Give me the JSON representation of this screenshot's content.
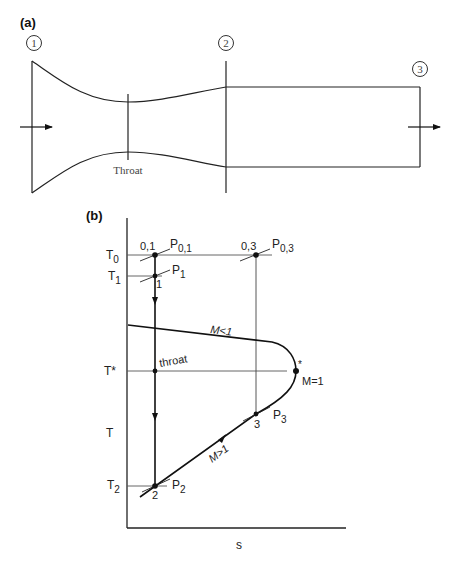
{
  "panel_a": {
    "label": "(a)",
    "stations": [
      "1",
      "2",
      "3"
    ],
    "throat_label": "Throat",
    "flow_direction": "left-to-right"
  },
  "panel_b": {
    "label": "(b)",
    "axis": {
      "y_label": "T",
      "x_label": "s"
    },
    "temperature_levels": {
      "T0": {
        "main": "T",
        "sub": "0"
      },
      "T1": {
        "main": "T",
        "sub": "1"
      },
      "Tstar": {
        "main": "T*"
      },
      "T2": {
        "main": "T",
        "sub": "2"
      }
    },
    "points": {
      "p01": {
        "state": "0,1",
        "pressure_main": "P",
        "pressure_sub": "0,1"
      },
      "p03": {
        "state": "0,3",
        "pressure_main": "P",
        "pressure_sub": "0,3"
      },
      "p1": {
        "state": "1",
        "pressure_main": "P",
        "pressure_sub": "1"
      },
      "throat": {
        "label": "throat"
      },
      "p2": {
        "state": "2",
        "pressure_main": "P",
        "pressure_sub": "2"
      },
      "p3": {
        "state": "3",
        "pressure_main": "P",
        "pressure_sub": "3"
      },
      "sonic": {
        "marker": "*",
        "label": "M=1"
      }
    },
    "branches": {
      "subsonic": "M<1",
      "supersonic": "M>1"
    }
  }
}
